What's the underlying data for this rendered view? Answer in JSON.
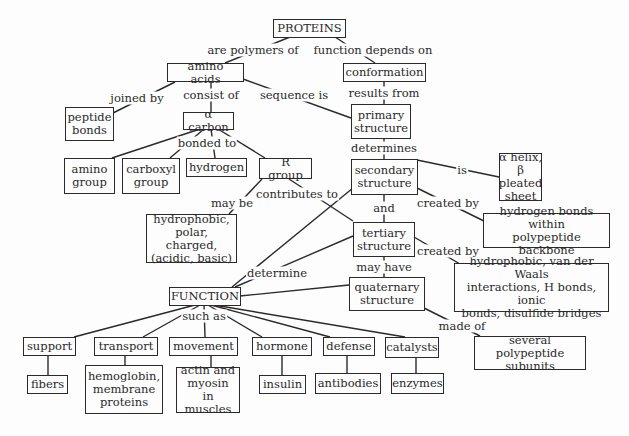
{
  "diagram": {
    "type": "concept-map",
    "nodes": {
      "proteins": "PROTEINS",
      "amino_acids": "amino acids",
      "conformation": "conformation",
      "peptide_bonds": "peptide\nbonds",
      "alpha_carbon": "α carbon",
      "primary_structure": "primary\nstructure",
      "amino_group": "amino\ngroup",
      "carboxyl_group": "carboxyl\ngroup",
      "hydrogen": "hydrogen",
      "r_group": "R group",
      "secondary_structure": "secondary\nstructure",
      "helix_sheet": "α  helix,\nβ pleated\nsheet",
      "hydrogen_bonds": "hydrogen bonds within\npolypeptide backbone",
      "tertiary_structure": "tertiary\nstructure",
      "r_group_types": "hydrophobic,\npolar, charged,\n(acidic, basic)",
      "tertiary_bonds": "hydrophobic, van der Waals\ninteractions, H bonds, ionic\nbonds, disulfide bridges",
      "function": "FUNCTION",
      "quaternary_structure": "quaternary\nstructure",
      "subunits": "several polypeptide\nsubunits",
      "support": "support",
      "fibers": "fibers",
      "transport": "transport",
      "transport_ex": "hemoglobin,\nmembrane\nproteins",
      "movement": "movement",
      "movement_ex": "actin and\nmyosin in\nmuscles",
      "hormone": "hormone",
      "hormone_ex": "insulin",
      "defense": "defense",
      "defense_ex": "antibodies",
      "catalysts": "catalysts",
      "catalysts_ex": "enzymes"
    },
    "links": {
      "are_polymers_of": "are polymers of",
      "function_depends_on": "function depends on",
      "joined_by": "joined by",
      "consist_of": "consist of",
      "sequence_is": "sequence is",
      "results_from": "results from",
      "bonded_to": "bonded to",
      "determines": "determines",
      "is": "is",
      "may_be": "may be",
      "contributes_to": "contributes to",
      "created_by_1": "created by",
      "and": "and",
      "created_by_2": "created by",
      "determine": "determine",
      "may_have": "may have",
      "made_of": "made of",
      "such_as": "such as"
    }
  }
}
